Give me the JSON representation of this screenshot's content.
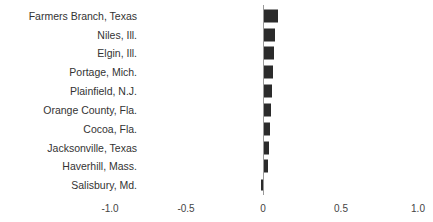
{
  "chart_data": {
    "type": "bar",
    "orientation": "horizontal",
    "title": "",
    "xlabel": "",
    "ylabel": "",
    "xlim": [
      -1.0,
      1.0
    ],
    "grid": false,
    "legend": null,
    "categories": [
      "Farmers Branch, Texas",
      "Niles, Ill.",
      "Elgin, Ill.",
      "Portage, Mich.",
      "Plainfield, N.J.",
      "Orange County, Fla.",
      "Cocoa, Fla.",
      "Jacksonville, Texas",
      "Haverhill, Mass.",
      "Salisbury, Md."
    ],
    "values": [
      0.09,
      0.07,
      0.065,
      0.06,
      0.055,
      0.045,
      0.04,
      0.03,
      0.025,
      -0.015
    ],
    "x_ticks": [
      "-1.0",
      "-0.5",
      "0",
      "0.5",
      "1.0"
    ],
    "x_tick_values": [
      -1.0,
      -0.5,
      0,
      0.5,
      1.0
    ],
    "bar_color": "#2b2b2b"
  }
}
